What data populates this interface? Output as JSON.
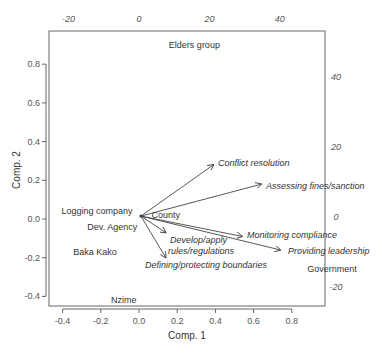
{
  "chart_data": {
    "type": "scatter",
    "subtype": "biplot",
    "xlabel": "Comp. 1",
    "ylabel": "Comp. 2",
    "xlim": [
      -0.47,
      0.98
    ],
    "ylim": [
      -0.46,
      0.97
    ],
    "x_ticks": [
      "-0.4",
      "-0.2",
      "0.0",
      "0.2",
      "0.4",
      "0.6",
      "0.8"
    ],
    "y_ticks": [
      "0.8",
      "0.6",
      "0.4",
      "0.2",
      "0.0",
      "-0.2",
      "-0.4"
    ],
    "top_ticks": [
      "-20",
      "0",
      "20",
      "40"
    ],
    "right_ticks": [
      "40",
      "20",
      "0",
      "-20"
    ],
    "observations": [
      {
        "label": "Elders group",
        "x": 0.29,
        "y": 0.9
      },
      {
        "label": "Logging company",
        "x": -0.22,
        "y": 0.04
      },
      {
        "label": "Dev. Agency",
        "x": -0.14,
        "y": -0.04
      },
      {
        "label": "County",
        "x": 0.14,
        "y": 0.02
      },
      {
        "label": "Baka Kako",
        "x": -0.23,
        "y": -0.17
      },
      {
        "label": "Government",
        "x": 1.01,
        "y": -0.26
      },
      {
        "label": "Nzime",
        "x": -0.08,
        "y": -0.42
      }
    ],
    "loadings": [
      {
        "label": "Conflict resolution",
        "x": 0.39,
        "y": 0.28
      },
      {
        "label": "Assessing fines/sanction",
        "x": 0.64,
        "y": 0.18
      },
      {
        "label": "Monitoring compliance",
        "x": 0.54,
        "y": -0.09
      },
      {
        "label": "Providing leadership",
        "x": 0.74,
        "y": -0.16
      },
      {
        "label": "Develop/apply rules/regulations",
        "label_lines": [
          "Develop/apply",
          "rules/regulations"
        ],
        "x": 0.14,
        "y": -0.07
      },
      {
        "label": "Defining/protecting boundaries",
        "x": 0.14,
        "y": -0.2
      }
    ],
    "grid": false,
    "legend": null
  }
}
